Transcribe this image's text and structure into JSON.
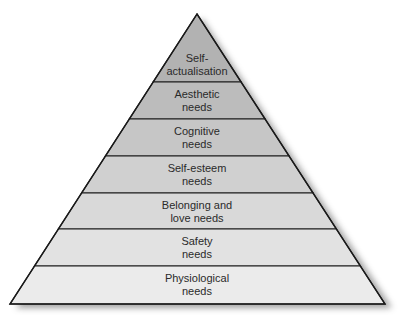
{
  "diagram": {
    "type": "pyramid",
    "levels_top_to_bottom": [
      {
        "label": "Self-\nactualisation",
        "fill": "#b2b2b2"
      },
      {
        "label": "Aesthetic\nneeds",
        "fill": "#bcbcbc"
      },
      {
        "label": "Cognitive\nneeds",
        "fill": "#c6c6c6"
      },
      {
        "label": "Self-esteem\nneeds",
        "fill": "#d0d0d0"
      },
      {
        "label": "Belonging and\nlove needs",
        "fill": "#d9d9d9"
      },
      {
        "label": "Safety\nneeds",
        "fill": "#e2e2e2"
      },
      {
        "label": "Physiological\nneeds",
        "fill": "#ebebeb"
      }
    ],
    "stroke_color": "#1a1a1a",
    "shadow_color": "#555555"
  }
}
